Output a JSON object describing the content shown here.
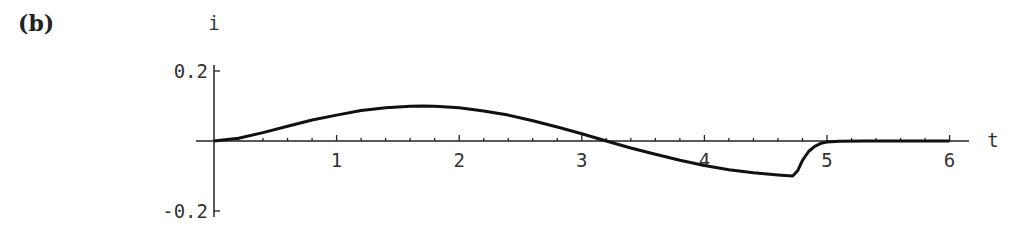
{
  "panel_label": "(b)",
  "chart_data": {
    "type": "line",
    "title": "",
    "xlabel": "t",
    "ylabel": "i",
    "xlim": [
      0,
      6.15
    ],
    "ylim": [
      -0.2,
      0.2
    ],
    "x_ticks": [
      1,
      2,
      3,
      4,
      5,
      6
    ],
    "x_tick_labels": [
      "1",
      "2",
      "3",
      "4",
      "5",
      "6"
    ],
    "y_ticks": [
      0.2,
      -0.2
    ],
    "y_tick_labels": [
      "0.2",
      "-0.2"
    ],
    "grid": false,
    "legend": null,
    "series": [
      {
        "name": "i(t)",
        "x": [
          0,
          0.2,
          0.4,
          0.6,
          0.8,
          1.0,
          1.2,
          1.4,
          1.6,
          1.7,
          1.8,
          2.0,
          2.2,
          2.4,
          2.6,
          2.8,
          3.0,
          3.2,
          3.4,
          3.6,
          3.8,
          4.0,
          4.2,
          4.4,
          4.6,
          4.72,
          4.76,
          4.8,
          4.85,
          4.9,
          4.95,
          5.0,
          5.1,
          5.3,
          5.6,
          6.0
        ],
        "y": [
          0,
          0.008,
          0.024,
          0.042,
          0.06,
          0.074,
          0.087,
          0.095,
          0.099,
          0.1,
          0.099,
          0.095,
          0.086,
          0.074,
          0.058,
          0.04,
          0.021,
          0.0,
          -0.02,
          -0.038,
          -0.055,
          -0.07,
          -0.082,
          -0.091,
          -0.097,
          -0.1,
          -0.085,
          -0.055,
          -0.03,
          -0.015,
          -0.007,
          -0.003,
          -0.001,
          0,
          0,
          0
        ]
      }
    ]
  }
}
